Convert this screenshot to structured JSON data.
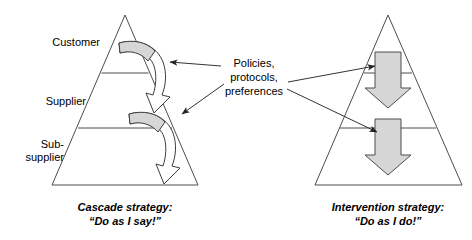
{
  "diagram": {
    "colors": {
      "arrow_fill": "#d6d6d6",
      "arrow_stroke": "#4d4d4d",
      "pyramid_stroke": "#4d4d4d",
      "connector_stroke": "#333333",
      "text": "#000000",
      "background": "#ffffff"
    },
    "left_pyramid": {
      "name": "cascade-pyramid",
      "tiers": [
        {
          "label": "Customer"
        },
        {
          "label": "Supplier"
        },
        {
          "label": "Sub-\nsupplier"
        }
      ],
      "caption_line1": "Cascade strategy:",
      "caption_line2": "“Do as I say!”",
      "flow_arrows": [
        {
          "name": "cascade-curved-arrow-upper",
          "description": "curved arrow from customer tier down to supplier tier"
        },
        {
          "name": "cascade-curved-arrow-lower",
          "description": "curved arrow from supplier tier down to sub-supplier tier"
        }
      ]
    },
    "right_pyramid": {
      "name": "intervention-pyramid",
      "caption_line1": "Intervention strategy:",
      "caption_line2": "“Do as I do!”",
      "flow_arrows": [
        {
          "name": "intervention-down-arrow-upper",
          "description": "thick straight down arrow crossing the upper tier divider"
        },
        {
          "name": "intervention-down-arrow-lower",
          "description": "thick straight down arrow crossing the lower tier divider"
        }
      ]
    },
    "center_note": {
      "name": "policies-note",
      "line1": "Policies,",
      "line2": "protocols,",
      "line3": "preferences",
      "connectors": [
        {
          "name": "connector-to-cascade-upper",
          "direction": "left"
        },
        {
          "name": "connector-to-cascade-lower",
          "direction": "left-down"
        },
        {
          "name": "connector-to-intervention-upper",
          "direction": "right"
        },
        {
          "name": "connector-to-intervention-lower",
          "direction": "right-down"
        }
      ]
    }
  }
}
